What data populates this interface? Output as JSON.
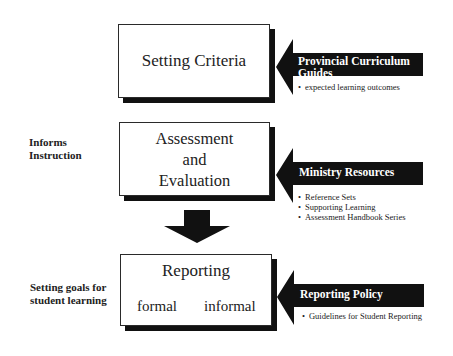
{
  "diagram": {
    "boxes": [
      {
        "id": "setting-criteria",
        "title": "Setting Criteria"
      },
      {
        "id": "assessment-evaluation",
        "title_lines": [
          "Assessment",
          "and",
          "Evaluation"
        ]
      },
      {
        "id": "reporting",
        "title": "Reporting",
        "sub_items": [
          "formal",
          "informal"
        ]
      }
    ],
    "side_labels": {
      "informs_instruction": [
        "Informs",
        "Instruction"
      ],
      "setting_goals": [
        "Setting goals for",
        "student learning"
      ]
    },
    "inputs": [
      {
        "label_lines": [
          "Provincial Curriculum",
          "Guides"
        ],
        "bullets": [
          "expected learning outcomes"
        ]
      },
      {
        "label_lines": [
          "Ministry Resources"
        ],
        "bullets": [
          "Reference Sets",
          "Supporting Learning",
          "Assessment Handbook Series"
        ]
      },
      {
        "label_lines": [
          "Reporting Policy"
        ],
        "bullets": [
          "Guidelines for Student Reporting"
        ]
      }
    ],
    "flow_arrow": "down-arrow from Assessment and Evaluation to Reporting",
    "colors": {
      "arrow_fill": "#111111",
      "box_border": "#2a2a2a",
      "background": "#ffffff"
    }
  }
}
